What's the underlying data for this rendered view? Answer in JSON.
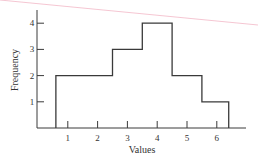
{
  "chart_data": {
    "type": "bar",
    "style": "histogram-outline",
    "title": "",
    "xlabel": "Values",
    "ylabel": "Frequency",
    "categories": [
      "1",
      "2",
      "3",
      "4",
      "5",
      "6"
    ],
    "values": [
      2,
      2,
      3,
      4,
      2,
      1
    ],
    "bins": [
      {
        "from": 0.6,
        "to": 1.5,
        "value": 2
      },
      {
        "from": 1.5,
        "to": 2.5,
        "value": 2
      },
      {
        "from": 2.5,
        "to": 3.5,
        "value": 3
      },
      {
        "from": 3.5,
        "to": 4.5,
        "value": 4
      },
      {
        "from": 4.5,
        "to": 5.5,
        "value": 2
      },
      {
        "from": 5.5,
        "to": 6.4,
        "value": 1
      }
    ],
    "x_ticks": [
      "1",
      "2",
      "3",
      "4",
      "5",
      "6"
    ],
    "y_ticks": [
      "1",
      "2",
      "3",
      "4"
    ],
    "xlim": [
      0,
      7
    ],
    "ylim": [
      0,
      4.5
    ],
    "grid": false,
    "legend": null,
    "line_color": "#3a3a3a"
  },
  "decoration": {
    "stray_line_color": "#f2b8c6"
  }
}
